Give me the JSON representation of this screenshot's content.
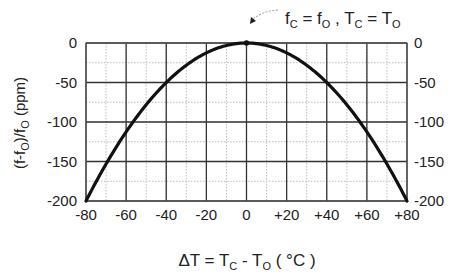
{
  "chart_data": {
    "type": "line",
    "title": "",
    "annotation": {
      "text_parts": [
        "f",
        "C",
        " = f",
        "O",
        " , T",
        "C",
        " = T",
        "O"
      ],
      "target": {
        "x": 0,
        "y": 0
      }
    },
    "xlabel": "ΔT = TC - TO ( °C )",
    "xlabel_parts": {
      "prefix": "ΔT = T",
      "sub1": "C",
      "mid": " - T",
      "sub2": "O",
      "suffix": " ( °C )"
    },
    "ylabel": "(f-fO)/fO (ppm)",
    "ylabel_parts": {
      "a": "(f-f",
      "sub1": "O",
      "b": ")/f",
      "sub2": "O",
      "c": " (ppm)"
    },
    "xlim": [
      -80,
      80
    ],
    "ylim": [
      -200,
      0
    ],
    "x_ticks": [
      -80,
      -60,
      -40,
      -20,
      0,
      20,
      40,
      60,
      80
    ],
    "x_tick_labels": [
      "-80",
      "-60",
      "-40",
      "-20",
      "0",
      "+20",
      "+40",
      "+60",
      "+80"
    ],
    "y_ticks": [
      0,
      -50,
      -100,
      -150,
      -200
    ],
    "y_tick_labels": [
      "0",
      "-50",
      "-100",
      "-150",
      "-200"
    ],
    "y_ticks_mirrored_right": true,
    "grid": {
      "major": true,
      "minor": true,
      "x_minor_step": 10,
      "y_minor_step": 25
    },
    "series": [
      {
        "name": "frequency deviation",
        "formula": "y = -0.03125 * x^2",
        "x": [
          -80,
          -70,
          -60,
          -50,
          -40,
          -30,
          -20,
          -10,
          0,
          10,
          20,
          30,
          40,
          50,
          60,
          70,
          80
        ],
        "values": [
          -200,
          -153.1,
          -112.5,
          -78.1,
          -50,
          -28.1,
          -12.5,
          -3.1,
          0,
          -3.1,
          -12.5,
          -28.1,
          -50,
          -78.1,
          -112.5,
          -153.1,
          -200
        ]
      }
    ],
    "legend": "none"
  },
  "colors": {
    "curve": "#111111",
    "major_grid": "#333333",
    "minor_grid": "#bdbdbd",
    "text": "#222222"
  }
}
